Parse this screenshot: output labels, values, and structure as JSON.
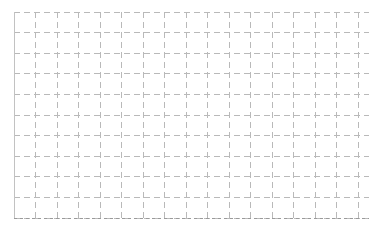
{
  "canvas": {
    "width": 381,
    "height": 230,
    "background_color": "#ffffff"
  },
  "chart_data": {
    "type": "table",
    "title": "",
    "subtitle": "",
    "xlabel": "",
    "ylabel": "",
    "categories": [],
    "values": [],
    "series": [],
    "x": [],
    "xlim": [
      14,
      369
    ],
    "ylim": [
      12,
      218
    ],
    "grid": true,
    "grid_style": "dashed",
    "legend": false,
    "legend_position": "none",
    "axis_tick_labels_x": [],
    "axis_tick_labels_y": [],
    "annotations": []
  },
  "grid": {
    "origin_x": 14,
    "origin_y": 12,
    "right_x": 369,
    "bottom_y": 218,
    "cell_width": 21.5,
    "cell_height": 20.6,
    "columns": 16,
    "rows": 10,
    "vertical_line_count": 17,
    "horizontal_line_count": 11,
    "line_color": "#b9b9b9",
    "line_color_strong": "#9a9a9a",
    "border_color": "#c2c2c2",
    "line_width": 1,
    "dash_pattern": "6 4",
    "dash_pattern_fine": "3 3"
  },
  "labels": {
    "title": "",
    "caption": "",
    "footnote": ""
  }
}
